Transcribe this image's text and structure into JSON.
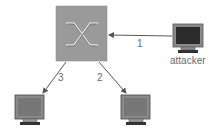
{
  "diagram": {
    "type": "network",
    "nodes": [
      {
        "id": "switch",
        "label": ""
      },
      {
        "id": "attacker",
        "label": "attacker"
      },
      {
        "id": "host-left",
        "label": ""
      },
      {
        "id": "host-right",
        "label": ""
      }
    ],
    "edges": [
      {
        "from": "attacker",
        "to": "switch",
        "label": "1"
      },
      {
        "from": "switch",
        "to": "host-right",
        "label": "2"
      },
      {
        "from": "switch",
        "to": "host-left",
        "label": "3"
      }
    ]
  },
  "colors": {
    "switch_fill": "#9a9a9a",
    "arrow": "#555555",
    "screen": "#333333",
    "monitor_frame": "#8a8a8a",
    "label": "#6a6a6a"
  }
}
